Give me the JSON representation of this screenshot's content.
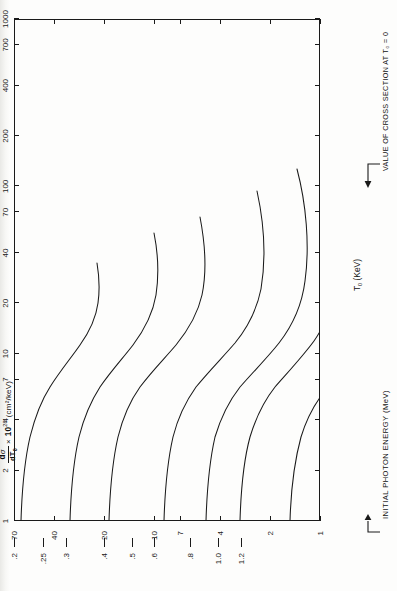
{
  "figure": {
    "title": {
      "numerator": "d",
      "numerator_sym": "σ",
      "denominator": "dT",
      "denominator_sub": "0",
      "times": "×",
      "factor_base": "10",
      "factor_exp": "28",
      "units": "(cm²/keV)"
    },
    "x_axis": {
      "label": "T",
      "label_sub": "0",
      "label_units": "(KeV)",
      "scale": "log",
      "min": 1,
      "max": 1000,
      "ticks": [
        1,
        2,
        4,
        7,
        10,
        20,
        40,
        70,
        100,
        200,
        400,
        700,
        1000
      ],
      "tick_labels": [
        "1",
        "2",
        "4",
        "7",
        "10",
        "20",
        "40",
        "70",
        "100",
        "200",
        "400",
        "700",
        "1000"
      ]
    },
    "y_axis": {
      "label": "",
      "scale": "log",
      "min": 1,
      "max": 70,
      "ticks": [
        1,
        2,
        4,
        7,
        10,
        20,
        40,
        70
      ],
      "tick_labels": [
        "1",
        "2",
        "4",
        "7",
        "10",
        "20",
        "40",
        "70"
      ]
    },
    "curve_axis_caption": "INITIAL PHOTON ENERGY  (MeV)",
    "cross_section_caption": "VALUE OF CROSS SECTION AT T₀ = 0",
    "curve_labels": [
      ".2",
      ".25",
      ".3",
      ".4",
      ".5",
      ".6",
      ".8",
      "1.0",
      "1.2"
    ],
    "colors": {
      "ink": "#1a1a1a",
      "paper": "#fdfdfc"
    }
  },
  "chart_data": {
    "type": "line",
    "xlabel": "T₀ (KeV)",
    "ylabel": "dσ/dT₀ × 10²⁸ (cm²/keV)",
    "xscale": "log",
    "yscale": "log",
    "xlim": [
      1,
      1000
    ],
    "ylim": [
      1,
      70
    ],
    "grid": false,
    "legend": "curve-end labels at T₀ = 1 KeV, annotated 'INITIAL PHOTON ENERGY (MeV)'",
    "annotations": [
      "INITIAL PHOTON ENERGY  (MeV)",
      "VALUE OF CROSS SECTION AT T₀ = 0"
    ],
    "series": [
      {
        "name": ".2",
        "photon_energy_MeV": 0.2,
        "x": [
          1,
          2,
          4,
          7,
          10,
          20,
          40,
          70,
          100,
          140
        ],
        "y": [
          70,
          69,
          67.5,
          65.5,
          63.5,
          58,
          49,
          41.5,
          38.5,
          37.5
        ]
      },
      {
        "name": ".25",
        "photon_energy_MeV": 0.25,
        "x": [
          1,
          2,
          4,
          7,
          10,
          20,
          40,
          70,
          100,
          150,
          200
        ],
        "y": [
          47,
          46.5,
          45.5,
          44,
          42.5,
          38.5,
          32,
          26.5,
          24,
          22.5,
          23
        ]
      },
      {
        "name": ".3",
        "photon_energy_MeV": 0.3,
        "x": [
          1,
          2,
          4,
          7,
          10,
          20,
          40,
          70,
          100,
          150,
          200,
          250
        ],
        "y": [
          34,
          33.5,
          32.5,
          31.5,
          30.5,
          27.5,
          22.5,
          18.5,
          16.5,
          15,
          15,
          16
        ]
      },
      {
        "name": ".4",
        "photon_energy_MeV": 0.4,
        "x": [
          1,
          2,
          4,
          7,
          10,
          20,
          40,
          70,
          100,
          200,
          300,
          400
        ],
        "y": [
          20,
          19.8,
          19.3,
          18.6,
          18,
          16.2,
          13.2,
          10.6,
          9.2,
          7.2,
          7.2,
          8.2
        ]
      },
      {
        "name": ".5",
        "photon_energy_MeV": 0.5,
        "x": [
          1,
          2,
          4,
          7,
          10,
          20,
          40,
          70,
          100,
          200,
          350,
          500
        ],
        "y": [
          13.6,
          13.5,
          13.2,
          12.7,
          12.3,
          11,
          9,
          7.1,
          6.1,
          4.4,
          3.9,
          4.6
        ]
      },
      {
        "name": ".6",
        "photon_energy_MeV": 0.6,
        "x": [
          1,
          2,
          4,
          7,
          10,
          20,
          40,
          70,
          100,
          200,
          400,
          600
        ],
        "y": [
          10,
          9.9,
          9.7,
          9.3,
          9,
          8.1,
          6.6,
          5.2,
          4.4,
          3.1,
          2.6,
          3.0
        ]
      },
      {
        "name": ".8",
        "photon_energy_MeV": 0.8,
        "x": [
          1,
          2,
          4,
          7,
          10,
          20,
          40,
          70,
          100,
          200,
          400,
          650,
          800
        ],
        "y": [
          6.1,
          6.05,
          5.9,
          5.7,
          5.5,
          4.9,
          4.0,
          3.1,
          2.65,
          1.8,
          1.4,
          1.45,
          1.8
        ]
      },
      {
        "name": "1.0",
        "photon_energy_MeV": 1.0,
        "x": [
          1,
          2,
          4,
          7,
          10,
          20,
          40,
          70,
          100,
          200,
          400,
          700,
          900,
          1000
        ],
        "y": [
          4.1,
          4.08,
          4.0,
          3.87,
          3.75,
          3.33,
          2.7,
          2.1,
          1.78,
          1.2,
          0.9,
          0.88,
          1.05,
          1.25
        ]
      },
      {
        "name": "1.2",
        "photon_energy_MeV": 1.2,
        "x": [
          1,
          2,
          4,
          7,
          10,
          20,
          40,
          70,
          100,
          200,
          400,
          700,
          1000
        ],
        "y": [
          3.0,
          2.99,
          2.93,
          2.84,
          2.75,
          2.44,
          1.97,
          1.53,
          1.3,
          0.87,
          0.64,
          0.62,
          0.8
        ]
      }
    ],
    "zero_intercepts": {
      "description": "VALUE OF CROSS SECTION AT T₀ = 0",
      "labels": [
        ".2",
        ".25",
        ".3",
        ".4",
        ".5",
        ".6",
        ".8",
        "1.0",
        "1.2"
      ],
      "values": [
        70,
        47,
        34,
        20,
        13.6,
        10,
        6.1,
        4.1,
        3.0
      ]
    }
  }
}
